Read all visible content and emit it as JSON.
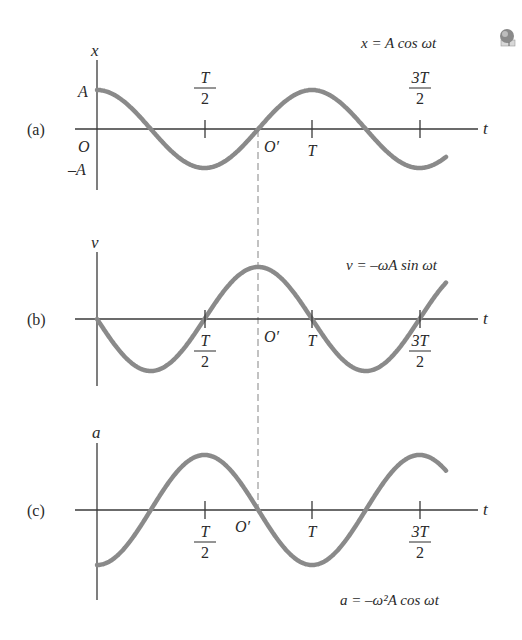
{
  "figure": {
    "icon": "globe-icon",
    "period_px": 215,
    "origin_x": 97,
    "axis_end_x": 478,
    "curve_end_x": 446,
    "dashed_line_x": 258,
    "ticks": [
      {
        "label_num": "T",
        "label_den": "2",
        "x": 205
      },
      {
        "label_num": "T",
        "label_den": "",
        "x": 312
      },
      {
        "label_num": "3T",
        "label_den": "2",
        "x": 420
      }
    ],
    "curve_color": "#8a8a8a",
    "axis_color": "#3a3a3a"
  },
  "panels": [
    {
      "id": "a",
      "panel_label": "(a)",
      "y_axis_label": "x",
      "t_axis_label": "t",
      "equation": "x = A cos ωt",
      "amplitude_labels": {
        "top": "A",
        "bottom": "–A"
      },
      "origin_label": "O",
      "origin_prime_label": "O′",
      "axis_y": 129,
      "amplitude_px": 39,
      "function": "cos",
      "sign": 1
    },
    {
      "id": "b",
      "panel_label": "(b)",
      "y_axis_label": "v",
      "t_axis_label": "t",
      "equation": "v = –ωA sin ωt",
      "origin_prime_label": "O′",
      "axis_y": 319,
      "amplitude_px": 52,
      "function": "sin",
      "sign": -1
    },
    {
      "id": "c",
      "panel_label": "(c)",
      "y_axis_label": "a",
      "t_axis_label": "t",
      "equation": "a = –ω²A cos ωt",
      "origin_prime_label": "O′",
      "axis_y": 510,
      "amplitude_px": 55,
      "function": "cos",
      "sign": -1
    }
  ],
  "chart_data": [
    {
      "type": "line",
      "title": "(a) x = A cos ωt",
      "xlabel": "t",
      "ylabel": "x",
      "x_ticks": [
        "O",
        "T/2",
        "T",
        "3T/2"
      ],
      "y_ticks": [
        "A",
        "O",
        "–A"
      ],
      "x": [
        0,
        0.25,
        0.5,
        0.75,
        1.0,
        1.25,
        1.5,
        1.62
      ],
      "values": [
        1,
        0,
        -1,
        0,
        1,
        0,
        -1,
        -0.72
      ],
      "annotations": [
        "O′ at t = 3T/4"
      ]
    },
    {
      "type": "line",
      "title": "(b) v = –ωA sin ωt",
      "xlabel": "t",
      "ylabel": "v",
      "x_ticks": [
        "T/2",
        "T",
        "3T/2"
      ],
      "x": [
        0,
        0.25,
        0.5,
        0.75,
        1.0,
        1.25,
        1.5,
        1.62
      ],
      "values": [
        0,
        -1,
        0,
        1,
        0,
        -1,
        0,
        0.68
      ],
      "annotations": [
        "O′ at t = 3T/4"
      ]
    },
    {
      "type": "line",
      "title": "(c) a = –ω²A cos ωt",
      "xlabel": "t",
      "ylabel": "a",
      "x_ticks": [
        "T/2",
        "T",
        "3T/2"
      ],
      "x": [
        0,
        0.25,
        0.5,
        0.75,
        1.0,
        1.25,
        1.5,
        1.62
      ],
      "values": [
        -1,
        0,
        1,
        0,
        -1,
        0,
        1,
        0.72
      ],
      "annotations": [
        "O′ at t = 3T/4"
      ]
    }
  ]
}
